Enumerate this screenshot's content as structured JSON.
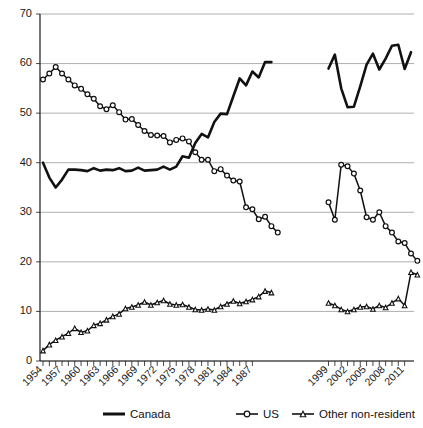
{
  "chart_data": {
    "type": "line",
    "title": "",
    "subtitle": "",
    "xlabel": "",
    "ylabel": "",
    "ylim": [
      0,
      70
    ],
    "y_ticks": [
      0,
      10,
      20,
      30,
      40,
      50,
      60,
      70
    ],
    "grid": true,
    "grid_axis": "y",
    "legend_position": "bottom",
    "x_tick_labels": [
      "1954",
      "1957",
      "1960",
      "1963",
      "1966",
      "1969",
      "1972",
      "1975",
      "1978",
      "1981",
      "1984",
      "1987",
      "1999",
      "2002",
      "2005",
      "2008",
      "2011"
    ],
    "x_minor_ticks_every": 1,
    "x_label_every": 3,
    "x_break": {
      "after": 1987,
      "resumes": 1999,
      "note": "data gap between 1988 and 1998"
    },
    "panels": [
      {
        "name": "panel-left",
        "x": [
          1954,
          1955,
          1956,
          1957,
          1958,
          1959,
          1960,
          1961,
          1962,
          1963,
          1964,
          1965,
          1966,
          1967,
          1968,
          1969,
          1970,
          1971,
          1972,
          1973,
          1974,
          1975,
          1976,
          1977,
          1978,
          1979,
          1980,
          1981,
          1982,
          1983,
          1984,
          1985,
          1986,
          1987
        ]
      },
      {
        "name": "panel-right",
        "x": [
          1999,
          2000,
          2001,
          2002,
          2003,
          2004,
          2005,
          2006,
          2007,
          2008,
          2009,
          2010,
          2011,
          2012
        ]
      }
    ],
    "series": [
      {
        "name": "Canada",
        "marker": "none",
        "line": "solid-thick",
        "panel_left_values": [
          40.0,
          37.0,
          35.0,
          36.6,
          38.6,
          38.6,
          38.5,
          38.3,
          38.9,
          38.4,
          38.6,
          38.5,
          38.9,
          38.3,
          38.4,
          39.0,
          38.4,
          38.5,
          38.6,
          39.2,
          38.6,
          39.2,
          41.3,
          41.0,
          44.0,
          45.8,
          45.1,
          48.2,
          49.9,
          49.8,
          53.4,
          57.0,
          55.6,
          58.4,
          57.2,
          60.3,
          60.3
        ],
        "panel_right_values": [
          59.0,
          61.8,
          55.0,
          51.2,
          51.3,
          55.4,
          59.8,
          62.0,
          58.8,
          61.0,
          63.6,
          63.8,
          58.9,
          62.3
        ]
      },
      {
        "name": "US",
        "marker": "circle-open",
        "line": "solid-thin",
        "panel_left_values": [
          56.8,
          58.0,
          59.3,
          58.0,
          56.8,
          55.6,
          54.9,
          53.8,
          52.9,
          51.4,
          50.8,
          51.6,
          50.2,
          48.7,
          48.8,
          47.6,
          46.4,
          45.6,
          45.5,
          45.4,
          44.1,
          44.6,
          44.9,
          44.3,
          42.1,
          40.6,
          40.6,
          38.3,
          38.7,
          37.4,
          36.4,
          36.2,
          31.0,
          30.6,
          28.6,
          29.1,
          27.2,
          25.9
        ],
        "panel_right_values": [
          32.0,
          28.5,
          39.6,
          39.3,
          37.8,
          34.4,
          29.0,
          28.5,
          30.0,
          27.2,
          25.9,
          24.1,
          23.8,
          21.7,
          20.2
        ]
      },
      {
        "name": "Other non-resident",
        "marker": "triangle-open",
        "line": "solid-thin",
        "panel_left_values": [
          2.1,
          3.3,
          4.2,
          4.9,
          5.6,
          6.6,
          5.8,
          6.1,
          7.2,
          7.6,
          8.3,
          9.0,
          9.5,
          10.6,
          10.9,
          11.3,
          11.9,
          11.3,
          11.8,
          12.2,
          11.5,
          11.3,
          11.4,
          10.9,
          10.4,
          10.3,
          10.5,
          10.3,
          11.0,
          11.5,
          12.1,
          11.6,
          12.0,
          12.4,
          13.0,
          14.1,
          13.8
        ],
        "panel_right_values": [
          11.7,
          11.2,
          10.4,
          10.0,
          10.4,
          10.9,
          11.0,
          10.5,
          11.2,
          10.8,
          11.7,
          12.6,
          11.2,
          17.9,
          17.4
        ]
      }
    ]
  },
  "legend": {
    "items": [
      {
        "label": "Canada",
        "marker": "none"
      },
      {
        "label": "US",
        "marker": "circle-open"
      },
      {
        "label": "Other non-resident",
        "marker": "triangle-open"
      }
    ]
  }
}
